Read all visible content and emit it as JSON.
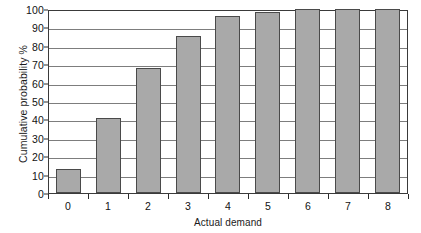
{
  "chart_data": {
    "type": "bar",
    "title": "",
    "xlabel": "Actual demand",
    "ylabel": "Cumulative probability %",
    "categories": [
      "0",
      "1",
      "2",
      "3",
      "4",
      "5",
      "6",
      "7",
      "8"
    ],
    "values": [
      13,
      40.5,
      68,
      85.5,
      96,
      98.5,
      100,
      100,
      100
    ],
    "ylim": [
      0,
      100
    ],
    "yticks": [
      0,
      10,
      20,
      30,
      40,
      50,
      60,
      70,
      80,
      90,
      100
    ],
    "ytick_labels": [
      "0",
      "10",
      "20",
      "30",
      "40",
      "50",
      "60",
      "70",
      "80",
      "90",
      "100"
    ],
    "grid": "horizontal",
    "legend": "none",
    "bar_color": "#a9a9a9",
    "bar_edge_color": "#4a4a4a",
    "grid_color": "#7d7d7d",
    "axis_color": "#3a3a3a"
  }
}
